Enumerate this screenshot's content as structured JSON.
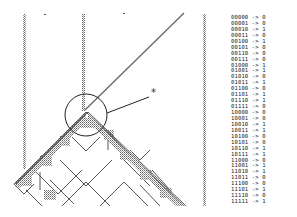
{
  "annotation": {
    "marker": "*"
  },
  "rules": [
    {
      "in": "00000",
      "arrow": "->",
      "out": "0"
    },
    {
      "in": "00001",
      "arrow": "->",
      "out": "0"
    },
    {
      "in": "00010",
      "arrow": "->",
      "out": "1"
    },
    {
      "in": "00011",
      "arrow": "->",
      "out": "0"
    },
    {
      "in": "00100",
      "arrow": "->",
      "out": "1"
    },
    {
      "in": "00101",
      "arrow": "->",
      "out": "0"
    },
    {
      "in": "00110",
      "arrow": "->",
      "out": "0"
    },
    {
      "in": "00111",
      "arrow": "->",
      "out": "0"
    },
    {
      "in": "01000",
      "arrow": "->",
      "out": "1"
    },
    {
      "in": "01001",
      "arrow": "->",
      "out": "1"
    },
    {
      "in": "01010",
      "arrow": "->",
      "out": "0"
    },
    {
      "in": "01011",
      "arrow": "->",
      "out": "1"
    },
    {
      "in": "01100",
      "arrow": "->",
      "out": "0"
    },
    {
      "in": "01101",
      "arrow": "->",
      "out": "1"
    },
    {
      "in": "01110",
      "arrow": "->",
      "out": "1"
    },
    {
      "in": "01111",
      "arrow": "->",
      "out": "0"
    },
    {
      "in": "10000",
      "arrow": "->",
      "out": "0"
    },
    {
      "in": "10001",
      "arrow": "->",
      "out": "0"
    },
    {
      "in": "10010",
      "arrow": "->",
      "out": "1"
    },
    {
      "in": "10011",
      "arrow": "->",
      "out": "1"
    },
    {
      "in": "10100",
      "arrow": "->",
      "out": "0"
    },
    {
      "in": "10101",
      "arrow": "->",
      "out": "0"
    },
    {
      "in": "10110",
      "arrow": "->",
      "out": "1"
    },
    {
      "in": "10111",
      "arrow": "->",
      "out": "1"
    },
    {
      "in": "11000",
      "arrow": "->",
      "out": "0"
    },
    {
      "in": "11001",
      "arrow": "->",
      "out": "1"
    },
    {
      "in": "11010",
      "arrow": "->",
      "out": "1"
    },
    {
      "in": "11011",
      "arrow": "->",
      "out": "0"
    },
    {
      "in": "11100",
      "arrow": "->",
      "out": "0"
    },
    {
      "in": "11101",
      "arrow": "->",
      "out": "1"
    },
    {
      "in": "11110",
      "arrow": "->",
      "out": "0"
    },
    {
      "in": "11111",
      "arrow": "->",
      "out": "1"
    }
  ],
  "colors": {
    "line": "#555555",
    "dots": "#777777",
    "circle": "#222222"
  }
}
